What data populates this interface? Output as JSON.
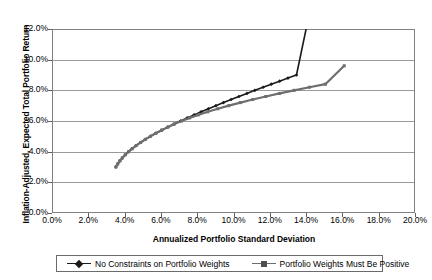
{
  "chart_data": {
    "type": "line",
    "title": "",
    "xlabel": "Annualized Portfolio Standard Deviation",
    "ylabel": "Inflation-Adjusted, Expected Total Portfolio Return",
    "xlim": [
      0.0,
      20.0
    ],
    "ylim": [
      0.0,
      12.0
    ],
    "grid": "horizontal",
    "legend_position": "bottom",
    "x_tick_labels": [
      "0.0%",
      "2.0%",
      "4.0%",
      "6.0%",
      "8.0%",
      "10.0%",
      "12.0%",
      "14.0%",
      "16.0%",
      "18.0%",
      "20.0%"
    ],
    "x_tick_values": [
      0,
      2,
      4,
      6,
      8,
      10,
      12,
      14,
      16,
      18,
      20
    ],
    "y_tick_labels": [
      "0.0%",
      "2.0%",
      "4.0%",
      "6.0%",
      "8.0%",
      "10.0%",
      "12.0%"
    ],
    "y_tick_values": [
      0,
      2,
      4,
      6,
      8,
      10,
      12
    ],
    "series": [
      {
        "name": "No Constraints on Portfolio Weights",
        "color": "#1a1a1a",
        "marker": "diamond",
        "x": [
          3.52,
          3.62,
          3.74,
          3.88,
          4.04,
          4.22,
          4.42,
          4.64,
          4.88,
          5.14,
          5.42,
          5.72,
          6.04,
          6.38,
          6.72,
          7.08,
          7.45,
          7.83,
          8.22,
          8.62,
          9.03,
          9.45,
          9.87,
          10.3,
          10.74,
          11.18,
          11.63,
          12.08,
          12.54,
          13.0,
          13.47,
          14.0
        ],
        "y": [
          3.0,
          3.2,
          3.4,
          3.6,
          3.8,
          4.0,
          4.2,
          4.4,
          4.6,
          4.8,
          5.0,
          5.2,
          5.4,
          5.6,
          5.8,
          6.0,
          6.2,
          6.4,
          6.6,
          6.8,
          7.0,
          7.2,
          7.4,
          7.6,
          7.8,
          8.0,
          8.2,
          8.4,
          8.6,
          8.8,
          9.0,
          12.0
        ]
      },
      {
        "name": "Portfolio Weights Must Be Positive",
        "color": "#6e6e6e",
        "marker": "square",
        "x": [
          3.52,
          3.62,
          3.74,
          3.88,
          4.04,
          4.22,
          4.42,
          4.64,
          4.88,
          5.14,
          5.42,
          5.72,
          6.04,
          6.38,
          6.74,
          7.14,
          7.58,
          8.06,
          8.58,
          9.14,
          9.74,
          10.38,
          11.06,
          11.78,
          12.54,
          13.34,
          14.18,
          15.06,
          16.1
        ],
        "y": [
          3.0,
          3.2,
          3.4,
          3.6,
          3.8,
          4.0,
          4.2,
          4.4,
          4.6,
          4.8,
          5.0,
          5.2,
          5.4,
          5.6,
          5.8,
          6.0,
          6.2,
          6.4,
          6.6,
          6.8,
          7.0,
          7.2,
          7.4,
          7.6,
          7.8,
          8.0,
          8.2,
          8.4,
          9.6
        ]
      }
    ]
  },
  "legend": {
    "items": [
      {
        "label": "No Constraints on Portfolio Weights"
      },
      {
        "label": "Portfolio Weights Must Be Positive"
      }
    ]
  }
}
